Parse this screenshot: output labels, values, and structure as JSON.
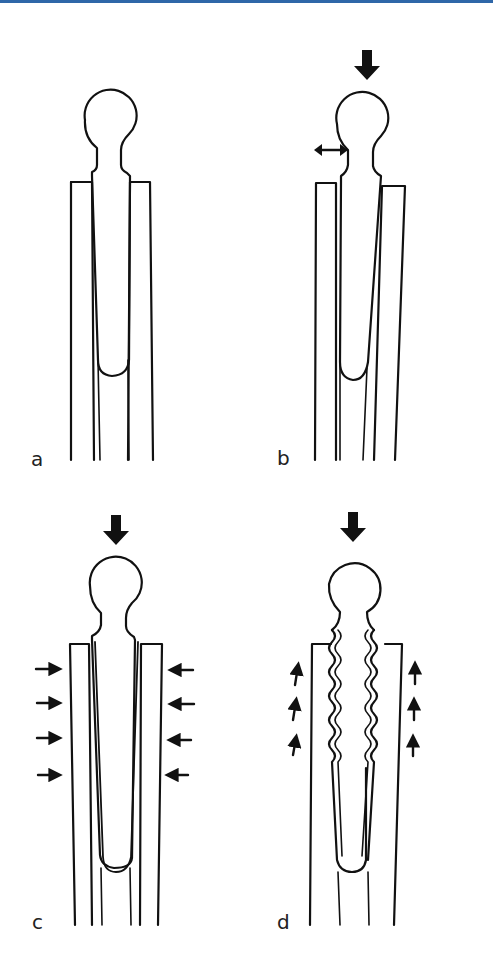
{
  "figure": {
    "top_rule_color": "#2f67a8",
    "panels": [
      {
        "id": "a",
        "label": "a",
        "description": "Stem seated in canal, no load"
      },
      {
        "id": "b",
        "label": "b",
        "description": "Axial load with lateral toggle",
        "arrows": [
          "down-arrow",
          "double-horizontal-arrow"
        ]
      },
      {
        "id": "c",
        "label": "c",
        "description": "Axial load with circumferential compression",
        "arrows": [
          "down-arrow",
          "4 inward arrows left",
          "4 inward arrows right"
        ]
      },
      {
        "id": "d",
        "label": "d",
        "description": "Axial load with wavy interface and upward shear",
        "arrows": [
          "down-arrow",
          "3 up arrows left",
          "3 up arrows right"
        ]
      }
    ]
  }
}
